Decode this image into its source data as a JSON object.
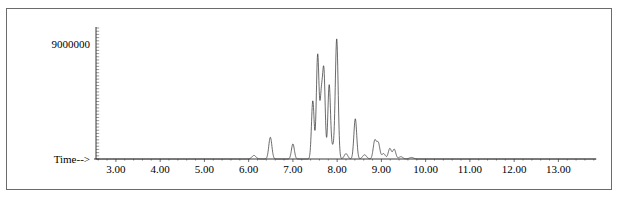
{
  "chart_data": {
    "type": "line",
    "title": "",
    "subtitle": "",
    "xlabel": "Time-->",
    "ylabel": "",
    "xlim": [
      2.55,
      13.85
    ],
    "ylim": [
      0,
      10400000
    ],
    "grid": false,
    "legend": null,
    "y_axis_annotation": "9000000",
    "y_annotation_value": 9000000,
    "x_tick_labels": [
      "3.00",
      "4.00",
      "5.00",
      "6.00",
      "7.00",
      "8.00",
      "9.00",
      "10.00",
      "11.00",
      "12.00",
      "13.00"
    ],
    "x_tick_values": [
      3,
      4,
      5,
      6,
      7,
      8,
      9,
      10,
      11,
      12,
      13
    ],
    "x_minor_tick_step": 0.2,
    "series": [
      {
        "name": "TIC",
        "baseline": 0,
        "peaks": [
          {
            "x": 6.12,
            "height": 280000,
            "width": 0.045
          },
          {
            "x": 6.49,
            "height": 1700000,
            "width": 0.035
          },
          {
            "x": 7.0,
            "height": 1180000,
            "width": 0.033
          },
          {
            "x": 7.45,
            "height": 4550000,
            "width": 0.03
          },
          {
            "x": 7.56,
            "height": 8150000,
            "width": 0.03
          },
          {
            "x": 7.64,
            "height": 4400000,
            "width": 0.028
          },
          {
            "x": 7.7,
            "height": 6750000,
            "width": 0.03
          },
          {
            "x": 7.82,
            "height": 5800000,
            "width": 0.03
          },
          {
            "x": 7.9,
            "height": 800000,
            "width": 0.03
          },
          {
            "x": 7.99,
            "height": 9400000,
            "width": 0.032
          },
          {
            "x": 8.2,
            "height": 420000,
            "width": 0.04
          },
          {
            "x": 8.41,
            "height": 3150000,
            "width": 0.032
          },
          {
            "x": 8.62,
            "height": 330000,
            "width": 0.045
          },
          {
            "x": 8.85,
            "height": 1420000,
            "width": 0.035
          },
          {
            "x": 8.93,
            "height": 1230000,
            "width": 0.035
          },
          {
            "x": 9.05,
            "height": 420000,
            "width": 0.04
          },
          {
            "x": 9.19,
            "height": 820000,
            "width": 0.035
          },
          {
            "x": 9.29,
            "height": 760000,
            "width": 0.035
          },
          {
            "x": 9.44,
            "height": 180000,
            "width": 0.045
          },
          {
            "x": 9.68,
            "height": 120000,
            "width": 0.05
          }
        ]
      }
    ]
  },
  "axes": {
    "x_title": "Time-->",
    "y_annotation": "9000000"
  }
}
